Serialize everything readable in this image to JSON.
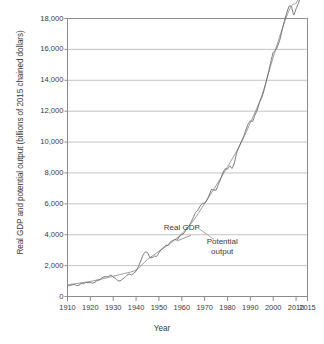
{
  "chart_data": {
    "type": "line",
    "title": "",
    "xlabel": "Year",
    "ylabel": "Real GDP and potential output (billions of 2015 chained dollars)",
    "xlim": [
      1910,
      2015
    ],
    "ylim": [
      0,
      18000
    ],
    "grid": true,
    "legend_position": "inline-annotations",
    "ytick_labels": [
      "0",
      "2,000",
      "4,000",
      "6,000",
      "8,000",
      "10,000",
      "12,000",
      "14,000",
      "16,000",
      "18,000"
    ],
    "ytick_values": [
      0,
      2000,
      4000,
      6000,
      8000,
      10000,
      12000,
      14000,
      16000,
      18000
    ],
    "xtick_labels": [
      "1910",
      "1920",
      "1930",
      "1940",
      "1950",
      "1960",
      "1970",
      "1980",
      "1990",
      "2000",
      "2010",
      "2015"
    ],
    "xtick_values": [
      1910,
      1920,
      1930,
      1940,
      1950,
      1960,
      1970,
      1980,
      1990,
      2000,
      2010,
      2015
    ],
    "annotations": [
      {
        "text": "Real GDP",
        "x": 1962,
        "y": 4150
      },
      {
        "text": "Potential output",
        "x": 1975,
        "y": 3350
      }
    ],
    "series": [
      {
        "name": "Real GDP",
        "color": "#6e6e6e",
        "x": [
          1910,
          1911,
          1912,
          1913,
          1914,
          1915,
          1916,
          1917,
          1918,
          1919,
          1920,
          1921,
          1922,
          1923,
          1924,
          1925,
          1926,
          1927,
          1928,
          1929,
          1930,
          1931,
          1932,
          1933,
          1934,
          1935,
          1936,
          1937,
          1938,
          1939,
          1940,
          1941,
          1942,
          1943,
          1944,
          1945,
          1946,
          1947,
          1948,
          1949,
          1950,
          1951,
          1952,
          1953,
          1954,
          1955,
          1956,
          1957,
          1958,
          1959,
          1960,
          1961,
          1962,
          1963,
          1964,
          1965,
          1966,
          1967,
          1968,
          1969,
          1970,
          1971,
          1972,
          1973,
          1974,
          1975,
          1976,
          1977,
          1978,
          1979,
          1980,
          1981,
          1982,
          1983,
          1984,
          1985,
          1986,
          1987,
          1988,
          1989,
          1990,
          1991,
          1992,
          1993,
          1994,
          1995,
          1996,
          1997,
          1998,
          1999,
          2000,
          2001,
          2002,
          2003,
          2004,
          2005,
          2006,
          2007,
          2008,
          2009,
          2010,
          2011,
          2012,
          2013,
          2014,
          2015
        ],
        "y": [
          700,
          710,
          755,
          775,
          710,
          730,
          840,
          830,
          905,
          900,
          895,
          870,
          920,
          1040,
          1070,
          1200,
          1280,
          1290,
          1305,
          1390,
          1265,
          1180,
          1025,
          1010,
          1120,
          1220,
          1380,
          1450,
          1400,
          1510,
          1640,
          1930,
          2290,
          2670,
          2880,
          2845,
          2530,
          2510,
          2615,
          2600,
          2830,
          3055,
          3175,
          3325,
          3305,
          3540,
          3615,
          3690,
          3655,
          3910,
          4005,
          4100,
          4350,
          4540,
          4800,
          5110,
          5440,
          5580,
          5845,
          6025,
          6035,
          6235,
          6560,
          6935,
          6900,
          6885,
          7260,
          7595,
          8015,
          8270,
          8250,
          8460,
          8290,
          8665,
          9290,
          9675,
          10005,
          10340,
          10770,
          11160,
          11365,
          11340,
          11740,
          12060,
          12560,
          12880,
          13360,
          13960,
          14570,
          15230,
          15800,
          15950,
          16225,
          16670,
          17310,
          17890,
          18400,
          18800,
          18755,
          18220,
          18630,
          18975,
          19380,
          19740,
          20230,
          20700
        ]
      },
      {
        "name": "Potential output",
        "color": "#8a8a8a",
        "x": [
          1910,
          1915,
          1920,
          1925,
          1930,
          1935,
          1940,
          1945,
          1950,
          1955,
          1960,
          1965,
          1970,
          1975,
          1980,
          1985,
          1990,
          1995,
          2000,
          2005,
          2008,
          2010,
          2012,
          2015
        ],
        "y": [
          760,
          860,
          975,
          1130,
          1310,
          1495,
          1720,
          2400,
          2920,
          3450,
          4060,
          4900,
          6030,
          7180,
          8400,
          9680,
          11250,
          13000,
          15500,
          17800,
          18800,
          19000,
          19550,
          20800
        ]
      }
    ]
  },
  "axes": {
    "ylabel": "Real GDP and potential output (billions of 2015 chained dollars)",
    "xlabel": "Year"
  },
  "annotations": {
    "real_gdp": "Real GDP",
    "potential_output_line1": "Potential",
    "potential_output_line2": "output"
  },
  "colors": {
    "real_gdp": "#6e6e6e",
    "potential_output": "#8a8a8a",
    "grid": "#b4b4b4",
    "axis": "#8c8c8c",
    "text": "#3a3a3a",
    "background": "#ffffff"
  }
}
